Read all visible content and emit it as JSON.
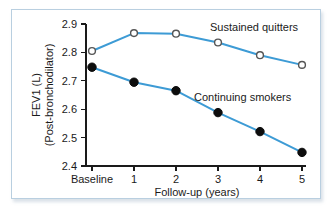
{
  "chart_data": {
    "type": "line",
    "title": "",
    "xlabel": "Follow-up (years)",
    "ylabel": "FEV1 (L)\n(Post-bronchodilator)",
    "ylabel_line1": "FEV1 (L)",
    "ylabel_line2": "(Post-bronchodilator)",
    "categories": [
      "Baseline",
      "1",
      "2",
      "3",
      "4",
      "5"
    ],
    "x": [
      0,
      1,
      2,
      3,
      4,
      5
    ],
    "ylim": [
      2.4,
      2.9
    ],
    "yticks": [
      "2.4",
      "2.5",
      "2.6",
      "2.7",
      "2.8",
      "2.9"
    ],
    "ytick_values": [
      2.4,
      2.5,
      2.6,
      2.7,
      2.8,
      2.9
    ],
    "grid": false,
    "legend_position": "inline-annotation",
    "series": [
      {
        "name": "Sustained quitters",
        "marker": "open-circle",
        "color": "#3d9bd5",
        "values": [
          2.805,
          2.868,
          2.866,
          2.835,
          2.79,
          2.756
        ]
      },
      {
        "name": "Continuing smokers",
        "marker": "filled-circle",
        "color": "#3d9bd5",
        "values": [
          2.748,
          2.695,
          2.665,
          2.588,
          2.521,
          2.448
        ]
      }
    ],
    "annotations": [
      {
        "text": "Sustained quitters",
        "x_px": 212,
        "y_px": 26
      },
      {
        "text": "Continuing smokers",
        "x_px": 196,
        "y_px": 96
      }
    ],
    "colors": {
      "line": "#3d9bd5",
      "marker_fill_open": "#ffffff",
      "marker_fill_solid": "#000000",
      "axis": "#1a1a1a",
      "frame_border": "#b9cfe0",
      "background": "#ffffff"
    }
  }
}
